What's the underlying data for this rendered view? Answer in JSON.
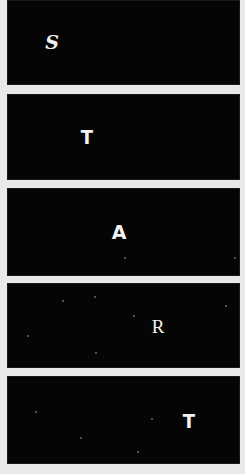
{
  "title_word": "START",
  "colors": {
    "background": "#e9e9e9",
    "panel": "#050505",
    "letter": "#f2f2f2",
    "star": "#6d6d6d"
  },
  "panels": [
    {
      "letter": "S",
      "style": "s",
      "top": 0,
      "height": 85,
      "letter_x": 45,
      "letter_y": 42,
      "stars": []
    },
    {
      "letter": "T",
      "style": "t",
      "top": 94,
      "height": 86,
      "letter_x": 80,
      "letter_y": 43,
      "stars": []
    },
    {
      "letter": "A",
      "style": "a",
      "top": 188,
      "height": 88,
      "letter_x": 112,
      "letter_y": 44,
      "stars": [
        [
          117,
          69
        ],
        [
          227,
          69
        ]
      ]
    },
    {
      "letter": "R",
      "style": "r",
      "top": 283,
      "height": 85,
      "letter_x": 151,
      "letter_y": 43,
      "stars": [
        [
          55,
          17
        ],
        [
          87,
          13
        ],
        [
          126,
          32
        ],
        [
          20,
          52
        ],
        [
          88,
          69
        ],
        [
          218,
          22
        ]
      ]
    },
    {
      "letter": "T",
      "style": "t",
      "top": 376,
      "height": 88,
      "letter_x": 182,
      "letter_y": 45,
      "stars": [
        [
          28,
          35
        ],
        [
          73,
          61
        ],
        [
          144,
          42
        ],
        [
          130,
          75
        ]
      ]
    }
  ]
}
